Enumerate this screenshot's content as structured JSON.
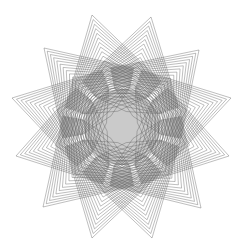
{
  "figure": {
    "background": "#ffffff",
    "stroke_color": "#555555",
    "points": [
      [
        92,
        15
      ],
      [
        151,
        17
      ],
      [
        199,
        50
      ],
      [
        231,
        98
      ],
      [
        229,
        156
      ],
      [
        201,
        208
      ],
      [
        152,
        238
      ],
      [
        92,
        238
      ],
      [
        43,
        207
      ],
      [
        16,
        156
      ],
      [
        12,
        98
      ],
      [
        44,
        48
      ]
    ],
    "inner_vertices_count": 12,
    "nested_layers": 22
  }
}
